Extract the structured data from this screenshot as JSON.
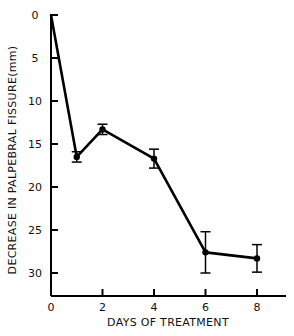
{
  "chart_data": {
    "type": "line",
    "title": "",
    "xlabel": "DAYS OF TREATMENT",
    "ylabel": "DECREASE IN PALPEBRAL FISSURE(mm)",
    "x": [
      0,
      1,
      2,
      4,
      6,
      8
    ],
    "series": [
      {
        "name": "Decrease in palpebral fissure",
        "values": [
          0,
          16.5,
          13.3,
          16.7,
          27.6,
          28.3
        ],
        "error": [
          0,
          0.6,
          0.6,
          1.1,
          2.4,
          1.6
        ]
      }
    ],
    "xticks": [
      "0",
      "2",
      "4",
      "6",
      "8"
    ],
    "yticks": [
      "0",
      "5",
      "10",
      "15",
      "20",
      "25",
      "30"
    ],
    "xlim": [
      0,
      9
    ],
    "ylim": [
      0,
      32
    ],
    "y_inverted": true,
    "grid": false,
    "legend": "none",
    "colors": {
      "line": "#000000",
      "background": "#ffffff"
    }
  }
}
